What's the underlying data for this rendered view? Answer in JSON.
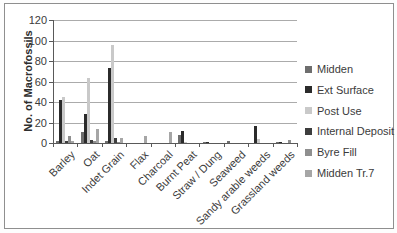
{
  "chart_data": {
    "type": "bar",
    "title": "",
    "xlabel": "",
    "ylabel": "No. of Macrofossils",
    "ylim": [
      0,
      120
    ],
    "ytick_step": 20,
    "yticks": [
      "120",
      "100",
      "80",
      "60",
      "40",
      "20",
      "0"
    ],
    "grid": true,
    "legend_position": "right",
    "categories": [
      "Barley",
      "Oat",
      "Indet Grain",
      "Flax",
      "Charcoal",
      "Burnt Peat",
      "Straw / Dung",
      "Seaweed",
      "Sandy arable weeds",
      "Grassland weeds"
    ],
    "series": [
      {
        "name": "Midden",
        "color": "#6e6e6e",
        "values": [
          2,
          11,
          2,
          0,
          0,
          8,
          1,
          2,
          0,
          1
        ]
      },
      {
        "name": "Ext Surface",
        "color": "#2b2b2b",
        "values": [
          42,
          28,
          73,
          0,
          0,
          12,
          1,
          0,
          17,
          1
        ]
      },
      {
        "name": "Post Use",
        "color": "#c9c9c9",
        "values": [
          45,
          63,
          96,
          0,
          0,
          1,
          0,
          0,
          4,
          0
        ]
      },
      {
        "name": "Internal Deposit",
        "color": "#3d3d3d",
        "values": [
          2,
          3,
          5,
          0,
          0,
          0,
          0,
          0,
          0,
          0
        ]
      },
      {
        "name": "Byre Fill",
        "color": "#8f8f8f",
        "values": [
          7,
          2,
          1,
          0,
          0,
          0,
          0,
          0,
          0,
          3
        ]
      },
      {
        "name": "Midden Tr.7",
        "color": "#a6a6a6",
        "values": [
          2,
          14,
          5,
          7,
          11,
          0,
          0,
          0,
          0,
          0
        ]
      }
    ]
  }
}
